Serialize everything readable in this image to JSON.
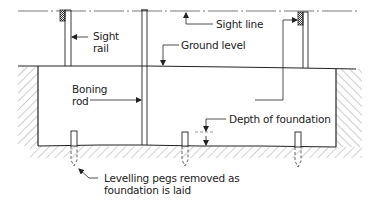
{
  "diagram": {
    "type": "setting-out-foundation-section",
    "labels": {
      "sight_line": "Sight line",
      "sight_rail_1": "Sight",
      "sight_rail_2": "rail",
      "ground_level": "Ground level",
      "boning_rod_1": "Boning",
      "boning_rod_2": "rod",
      "depth_of_foundation": "Depth of foundation",
      "levelling_pegs_1": "Levelling pegs removed as",
      "levelling_pegs_2": "foundation is laid"
    },
    "colors": {
      "line": "#222222",
      "hatch": "#9a9a9a",
      "background": "#ffffff"
    }
  }
}
